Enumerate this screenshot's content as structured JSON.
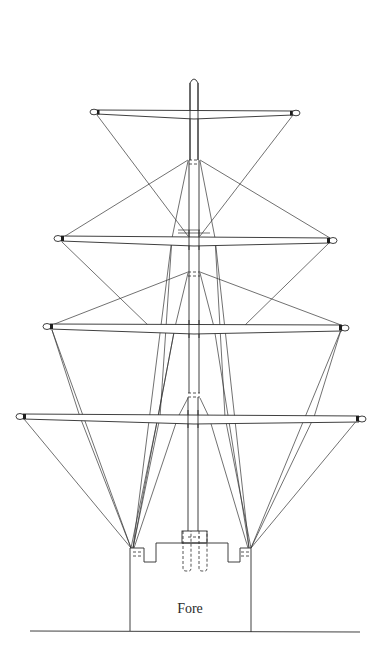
{
  "diagram": {
    "label": "Fore",
    "colors": {
      "line": "#2a2a2a",
      "background": "#ffffff"
    },
    "yards": [
      {
        "name": "royal-yard",
        "y": 113,
        "x_left": 94,
        "x_right": 296
      },
      {
        "name": "topgallant-yard",
        "y": 240,
        "x_left": 58,
        "x_right": 333
      },
      {
        "name": "topsail-yard",
        "y": 327,
        "x_left": 47,
        "x_right": 345
      },
      {
        "name": "lower-yard",
        "y": 417,
        "x_left": 20,
        "x_right": 362
      }
    ],
    "mast": {
      "x_center": 194,
      "top_y": 78,
      "base_y": 632
    },
    "ground_line": {
      "y": 632,
      "x_start": 30,
      "x_end": 360
    }
  }
}
